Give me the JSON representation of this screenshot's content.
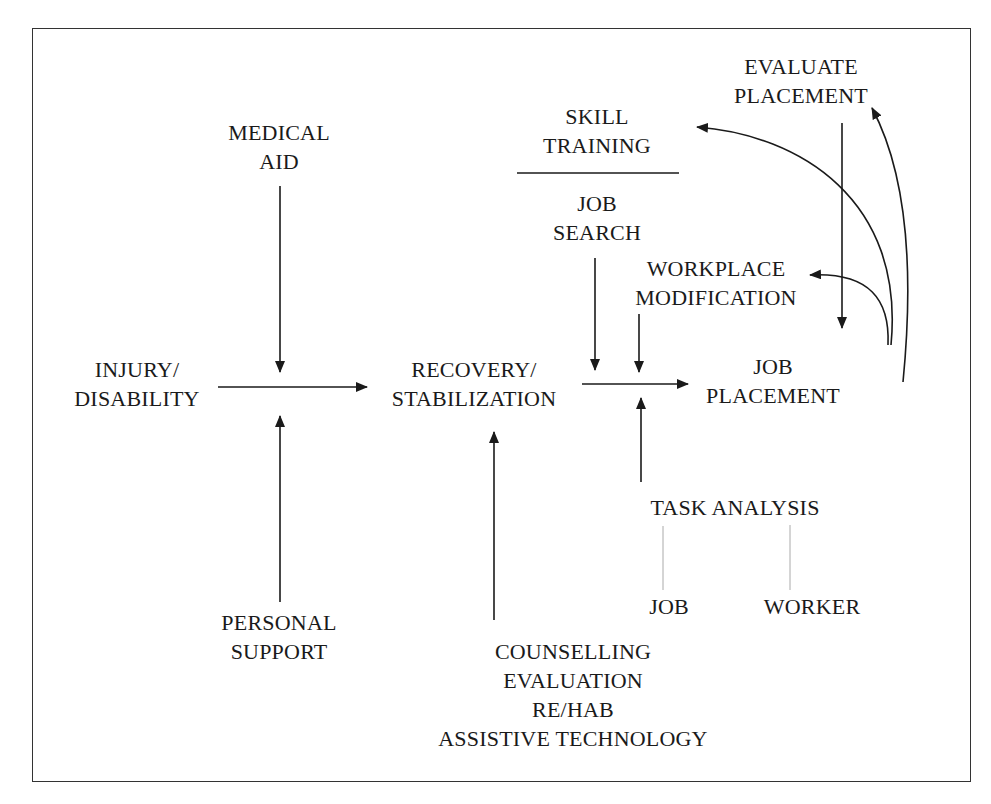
{
  "diagram": {
    "nodes": {
      "medical_aid": [
        "MEDICAL",
        "AID"
      ],
      "injury": [
        "INJURY/",
        "DISABILITY"
      ],
      "personal_support": [
        "PERSONAL",
        "SUPPORT"
      ],
      "recovery": [
        "RECOVERY/",
        "STABILIZATION"
      ],
      "counselling": [
        "COUNSELLING",
        "EVALUATION",
        "RE/HAB",
        "ASSISTIVE TECHNOLOGY"
      ],
      "skill_training": [
        "SKILL",
        "TRAINING"
      ],
      "job_search": [
        "JOB",
        "SEARCH"
      ],
      "workplace_mod": [
        "WORKPLACE",
        "MODIFICATION"
      ],
      "evaluate_placement": [
        "EVALUATE",
        "PLACEMENT"
      ],
      "job_placement": [
        "JOB",
        "PLACEMENT"
      ],
      "task_analysis": [
        "TASK ANALYSIS"
      ],
      "job": [
        "JOB"
      ],
      "worker": [
        "WORKER"
      ]
    },
    "edges": [
      {
        "from": "injury",
        "to": "recovery",
        "type": "arrow"
      },
      {
        "from": "medical_aid",
        "to": "injury->recovery",
        "type": "arrow"
      },
      {
        "from": "personal_support",
        "to": "injury->recovery",
        "type": "arrow"
      },
      {
        "from": "counselling",
        "to": "recovery",
        "type": "arrow"
      },
      {
        "from": "recovery",
        "to": "job_placement",
        "type": "arrow"
      },
      {
        "from": "job_search",
        "to": "recovery->job_placement",
        "type": "arrow"
      },
      {
        "from": "workplace_mod",
        "to": "recovery->job_placement",
        "type": "arrow"
      },
      {
        "from": "task_analysis",
        "to": "recovery->job_placement",
        "type": "arrow"
      },
      {
        "from": "evaluate_placement",
        "to": "job_placement",
        "type": "arrow"
      },
      {
        "from": "job_placement",
        "to": "evaluate_placement",
        "type": "curved-arrow"
      },
      {
        "from": "job_placement",
        "to": "skill_training",
        "type": "curved-arrow"
      },
      {
        "from": "job_placement",
        "to": "workplace_mod",
        "type": "curved-arrow"
      },
      {
        "from": "task_analysis",
        "to": "job",
        "type": "line"
      },
      {
        "from": "task_analysis",
        "to": "worker",
        "type": "line"
      }
    ],
    "colors": {
      "ink": "#1a1a1a",
      "border": "#333333",
      "thin_line": "#aaaaaa"
    }
  }
}
